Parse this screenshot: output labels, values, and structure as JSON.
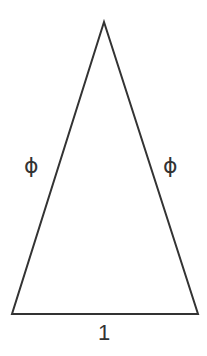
{
  "diagram": {
    "stroke_color": "#333333",
    "background": "#ffffff",
    "vertices": {
      "apex": [
        104,
        22
      ],
      "base_left": [
        12,
        314
      ],
      "base_right": [
        198,
        314
      ]
    },
    "labels": {
      "left_side": "ϕ",
      "right_side": "ϕ",
      "base": "1"
    }
  }
}
